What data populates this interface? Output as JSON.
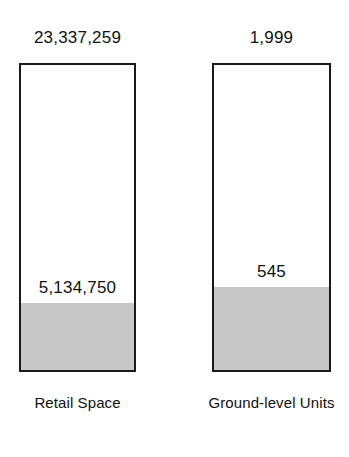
{
  "chart_data": {
    "type": "bar",
    "title": "",
    "subtitle": "",
    "xlabel": "",
    "ylabel": "",
    "grid": false,
    "legend": "none",
    "categories": [
      "Retail Space",
      "Ground-level Units"
    ],
    "series": [
      {
        "name": "Total",
        "values": [
          23337259,
          1999
        ],
        "value_labels": [
          "23,337,259",
          "1,999"
        ],
        "label_position": "above-bar"
      },
      {
        "name": "Filled portion",
        "values": [
          5134750,
          545
        ],
        "value_labels": [
          "5,134,750",
          "545"
        ],
        "label_position": "above-fill"
      }
    ],
    "fill_fractions": [
      0.22,
      0.2726
    ],
    "colors": {
      "bar_outline": "#1a1a1a",
      "bar_background": "#ffffff",
      "fill": "#c8c8c8",
      "text": "#111111",
      "page_background": "#ffffff"
    }
  },
  "bars": [
    {
      "id": "retail-space",
      "total_label": "23,337,259",
      "value_label": "5,134,750",
      "category_label": "Retail Space"
    },
    {
      "id": "ground-level-units",
      "total_label": "1,999",
      "value_label": "545",
      "category_label": "Ground-level Units"
    }
  ]
}
